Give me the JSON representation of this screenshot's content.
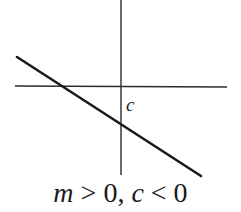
{
  "diagram": {
    "type": "line-graph-sketch",
    "axes": {
      "x_axis": {
        "from": [
          15,
          86
        ],
        "to": [
          227,
          87
        ]
      },
      "y_axis": {
        "from": [
          121,
          0
        ],
        "to": [
          121,
          175
        ]
      }
    },
    "line": {
      "from": [
        17,
        57
      ],
      "to": [
        201,
        176
      ],
      "slope_sign": "negative-looking (descending)"
    },
    "intercept_label": "c",
    "caption": {
      "m_var": "m",
      "rel1": " > 0, ",
      "c_var": "c",
      "rel2": " < 0"
    },
    "colors": {
      "ink": "#1a1a1a",
      "background": "#ffffff"
    }
  }
}
